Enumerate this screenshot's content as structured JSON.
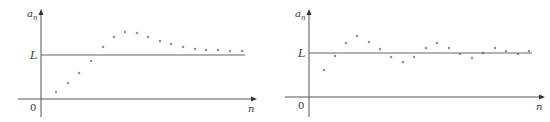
{
  "chart_data": [
    {
      "type": "scatter",
      "title": "",
      "xlabel": "n",
      "ylabel": "a_n",
      "ylabel_main": "a",
      "ylabel_sub": "n",
      "origin_label": "0",
      "limit_label": "L",
      "grid": false,
      "description": "Sequence rising from below L, overshooting, then converging down to L",
      "axis": {
        "x0": 41,
        "y0": 99,
        "x_end": 252,
        "y_top": 14,
        "x_left": 18,
        "y_bottom": 117
      },
      "limit_line": {
        "y": 55,
        "x1": 41,
        "x2": 245
      },
      "points_px": [
        [
          56,
          92
        ],
        [
          68,
          83
        ],
        [
          79,
          73
        ],
        [
          91,
          61
        ],
        [
          103,
          47
        ],
        [
          114,
          37
        ],
        [
          125,
          32
        ],
        [
          137,
          33
        ],
        [
          148,
          37
        ],
        [
          160,
          41
        ],
        [
          171,
          44
        ],
        [
          183,
          47
        ],
        [
          195,
          49
        ],
        [
          206,
          50
        ],
        [
          218,
          50
        ],
        [
          230,
          51
        ],
        [
          242,
          51
        ]
      ],
      "series": [
        {
          "name": "a_n",
          "n": [
            1,
            2,
            3,
            4,
            5,
            6,
            7,
            8,
            9,
            10,
            11,
            12,
            13,
            14,
            15,
            16,
            17
          ],
          "values_rel_L": [
            -0.84,
            -0.64,
            -0.41,
            -0.14,
            0.18,
            0.41,
            0.52,
            0.5,
            0.41,
            0.32,
            0.25,
            0.18,
            0.14,
            0.11,
            0.11,
            0.09,
            0.09
          ]
        }
      ]
    },
    {
      "type": "scatter",
      "title": "",
      "xlabel": "n",
      "ylabel": "a_n",
      "ylabel_main": "a",
      "ylabel_sub": "n",
      "origin_label": "0",
      "limit_label": "L",
      "grid": false,
      "description": "Sequence oscillating around L with decreasing amplitude",
      "axis": {
        "x0": 309,
        "y0": 97,
        "x_end": 540,
        "y_top": 14,
        "x_left": 285,
        "y_bottom": 117
      },
      "limit_line": {
        "y": 53,
        "x1": 309,
        "x2": 532
      },
      "points_px": [
        [
          324,
          70
        ],
        [
          335,
          56
        ],
        [
          346,
          43
        ],
        [
          357,
          36
        ],
        [
          369,
          42
        ],
        [
          380,
          49
        ],
        [
          391,
          57
        ],
        [
          403,
          62
        ],
        [
          414,
          57
        ],
        [
          426,
          48
        ],
        [
          437,
          43
        ],
        [
          449,
          48
        ],
        [
          460,
          54
        ],
        [
          472,
          58
        ],
        [
          483,
          53
        ],
        [
          495,
          48
        ],
        [
          506,
          51
        ],
        [
          518,
          54
        ],
        [
          529,
          51
        ]
      ],
      "series": [
        {
          "name": "a_n",
          "n": [
            1,
            2,
            3,
            4,
            5,
            6,
            7,
            8,
            9,
            10,
            11,
            12,
            13,
            14,
            15,
            16,
            17,
            18,
            19
          ],
          "values_rel_L": [
            -0.39,
            -0.07,
            0.23,
            0.39,
            0.25,
            0.09,
            -0.09,
            -0.2,
            -0.09,
            0.11,
            0.23,
            0.11,
            -0.02,
            -0.11,
            0.0,
            0.11,
            0.05,
            -0.02,
            0.05
          ]
        }
      ]
    }
  ]
}
